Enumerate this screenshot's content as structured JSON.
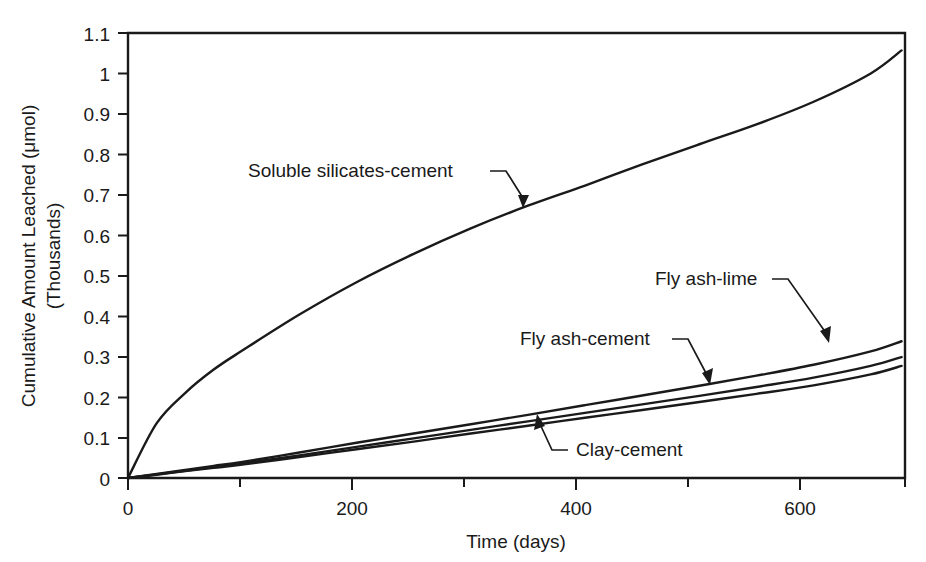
{
  "chart_data": {
    "type": "line",
    "title": "",
    "xlabel": "Time (days)",
    "ylabel": "Cumulative Amount Leached (μmol)",
    "ylabel_line2": "(Thousands)",
    "xlim": [
      0,
      680
    ],
    "ylim": [
      0,
      1.1
    ],
    "grid": false,
    "legend": "inline-annotations",
    "xticks": [
      0,
      200,
      400,
      600
    ],
    "xtick_labels": [
      "0",
      "200",
      "400",
      "600"
    ],
    "xminor_ticks": [
      100,
      300,
      500
    ],
    "yticks": [
      0,
      0.1,
      0.2,
      0.3,
      0.4,
      0.5,
      0.6,
      0.7,
      0.8,
      0.9,
      1.0,
      1.1
    ],
    "ytick_labels": [
      "0",
      "0.1",
      "0.2",
      "0.3",
      "0.4",
      "0.5",
      "0.6",
      "0.7",
      "0.8",
      "0.9",
      "1",
      "1.1"
    ],
    "x": [
      0,
      25,
      50,
      75,
      100,
      150,
      200,
      250,
      300,
      350,
      400,
      450,
      500,
      550,
      600,
      650,
      677
    ],
    "series": [
      {
        "name": "Soluble silicates-cement",
        "values": [
          0,
          0.135,
          0.21,
          0.268,
          0.315,
          0.404,
          0.484,
          0.554,
          0.617,
          0.673,
          0.723,
          0.775,
          0.825,
          0.874,
          0.93,
          1.0,
          1.057
        ]
      },
      {
        "name": "Fly ash-lime",
        "values": [
          0,
          0.01,
          0.02,
          0.03,
          0.04,
          0.063,
          0.087,
          0.11,
          0.133,
          0.156,
          0.18,
          0.204,
          0.228,
          0.253,
          0.28,
          0.313,
          0.338
        ]
      },
      {
        "name": "Fly ash-cement",
        "values": [
          0,
          0.009,
          0.018,
          0.027,
          0.036,
          0.056,
          0.077,
          0.098,
          0.119,
          0.14,
          0.161,
          0.182,
          0.203,
          0.225,
          0.248,
          0.277,
          0.299
        ]
      },
      {
        "name": "Clay-cement",
        "values": [
          0,
          0.008,
          0.017,
          0.025,
          0.033,
          0.052,
          0.071,
          0.09,
          0.11,
          0.129,
          0.149,
          0.168,
          0.188,
          0.208,
          0.229,
          0.256,
          0.277
        ]
      }
    ],
    "annotations": [
      {
        "name": "Soluble silicates-cement",
        "text_x": 248,
        "text_y": 177,
        "anchor": "start"
      },
      {
        "name": "Fly ash-lime",
        "text_x": 655,
        "text_y": 285,
        "anchor": "start"
      },
      {
        "name": "Fly ash-cement",
        "text_x": 520,
        "text_y": 345,
        "anchor": "start"
      },
      {
        "name": "Clay-cement",
        "text_x": 576,
        "text_y": 456,
        "anchor": "start"
      }
    ],
    "colors": {
      "line": "#1a1a1a",
      "axis": "#1a1a1a",
      "background": "#ffffff"
    }
  }
}
